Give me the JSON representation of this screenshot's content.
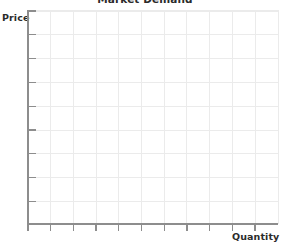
{
  "chart_data": {
    "type": "line",
    "title": "Market Demand",
    "xlabel": "Quantity",
    "ylabel": "Price",
    "series": [],
    "categories": [],
    "values": [],
    "x": [],
    "xlim": [
      0,
      11
    ],
    "ylim": [
      0,
      9
    ],
    "x_tick_labels": [],
    "y_tick_labels": [],
    "x_tick_count": 11,
    "y_tick_count": 9,
    "grid": true,
    "legend": false,
    "legend_position": "none",
    "annotations": [],
    "note": "Empty / blank axes template - no data plotted"
  },
  "figure": {
    "title": "Market Demand",
    "title_clipped_top": true,
    "axis": {
      "y_label": "Price",
      "x_label": "Quantity"
    },
    "colors": {
      "background": "#ffffff",
      "axis": "#8d8d8d",
      "grid": "#ebebeb",
      "text": "#2b2b2b"
    },
    "geometry": {
      "plot_left": 28,
      "plot_right": 278,
      "plot_top": 10,
      "plot_bottom": 224,
      "y_tick_spacing": 23.8,
      "x_tick_spacing": 22.7
    }
  }
}
